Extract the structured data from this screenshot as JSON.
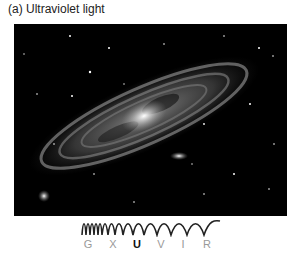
{
  "caption": "(a) Ultraviolet light",
  "image": {
    "subject": "galaxy-photo",
    "description": "Spiral galaxy viewed in ultraviolet light, with two small companion galaxies and scattered stars"
  },
  "spectrum": {
    "bands": [
      {
        "label": "G",
        "active": false
      },
      {
        "label": "X",
        "active": false
      },
      {
        "label": "U",
        "active": true
      },
      {
        "label": "V",
        "active": false
      },
      {
        "label": "I",
        "active": false
      },
      {
        "label": "R",
        "active": false
      }
    ]
  }
}
